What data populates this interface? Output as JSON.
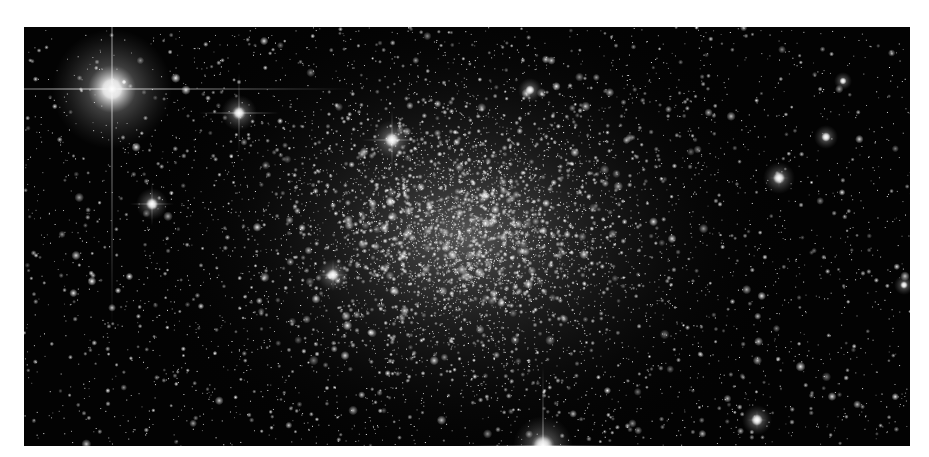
{
  "image": {
    "alt": "Globular star cluster on black sky with bright foreground stars and diffraction spikes",
    "subject": "globular-cluster",
    "frame": {
      "x": 24,
      "y": 27,
      "width": 886,
      "height": 419
    },
    "background_color": "#030303",
    "page_color": "#ffffff"
  },
  "cluster": {
    "core_center": [
      441,
      208
    ],
    "core_radius_x": 175,
    "core_radius_y": 130,
    "star_count": 5200,
    "field_star_count": 2600,
    "glow_alpha": 0.42,
    "seed": 1337
  },
  "bright_stars": [
    {
      "name": "spiked-star-top-left",
      "x": 88,
      "y": 62,
      "size": 10,
      "halo": 60,
      "spike": 240,
      "spike_alpha": 0.55
    },
    {
      "name": "star-left-mid",
      "x": 215,
      "y": 86,
      "size": 5,
      "halo": 18,
      "spike": 40,
      "spike_alpha": 0.35
    },
    {
      "name": "star-upper-center",
      "x": 368,
      "y": 113,
      "size": 6,
      "halo": 20,
      "spike": 30,
      "spike_alpha": 0.35
    },
    {
      "name": "star-left-lower",
      "x": 128,
      "y": 177,
      "size": 5,
      "halo": 16,
      "spike": 22,
      "spike_alpha": 0.3
    },
    {
      "name": "star-core-left",
      "x": 309,
      "y": 248,
      "size": 5,
      "halo": 16,
      "spike": 16,
      "spike_alpha": 0.25
    },
    {
      "name": "star-right",
      "x": 755,
      "y": 151,
      "size": 5,
      "halo": 16,
      "spike": 10,
      "spike_alpha": 0.2
    },
    {
      "name": "star-bottom-edge",
      "x": 519,
      "y": 419,
      "size": 9,
      "halo": 30,
      "spike": 80,
      "spike_alpha": 0.45
    },
    {
      "name": "star-lower-right",
      "x": 733,
      "y": 393,
      "size": 5,
      "halo": 15,
      "spike": 10,
      "spike_alpha": 0.2
    },
    {
      "name": "star-far-right",
      "x": 802,
      "y": 110,
      "size": 4,
      "halo": 12,
      "spike": 0,
      "spike_alpha": 0
    },
    {
      "name": "star-top-right",
      "x": 819,
      "y": 54,
      "size": 3,
      "halo": 9,
      "spike": 0,
      "spike_alpha": 0
    },
    {
      "name": "star-upper-mid",
      "x": 506,
      "y": 63,
      "size": 4,
      "halo": 12,
      "spike": 0,
      "spike_alpha": 0
    },
    {
      "name": "star-right-edge",
      "x": 880,
      "y": 258,
      "size": 3,
      "halo": 10,
      "spike": 0,
      "spike_alpha": 0
    },
    {
      "name": "star-lower-left",
      "x": 100,
      "y": 55,
      "size": 2,
      "halo": 6,
      "spike": 0,
      "spike_alpha": 0
    }
  ]
}
